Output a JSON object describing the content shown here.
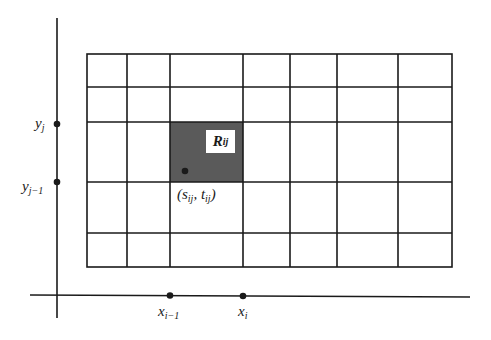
{
  "diagram": {
    "type": "riemann-partition-grid",
    "axes": {
      "y_axis_labels": [
        {
          "base": "y",
          "sub": "j"
        },
        {
          "base": "y",
          "sub": "j−1"
        }
      ],
      "x_axis_labels": [
        {
          "base": "x",
          "sub": "i−1"
        },
        {
          "base": "x",
          "sub": "i"
        }
      ]
    },
    "grid": {
      "columns": 8,
      "rows": 5,
      "vertical_lines_px": [
        87,
        127,
        170,
        243,
        290,
        337,
        398,
        452
      ],
      "horizontal_lines_px": [
        54,
        87,
        122,
        182,
        233,
        267
      ]
    },
    "highlighted_cell": {
      "label_base": "R",
      "label_sub": "ij",
      "fill": "#5a5a5a"
    },
    "sample_point": {
      "open": "(",
      "s_base": "s",
      "s_sub": "ij",
      "sep": ", ",
      "t_base": "t",
      "t_sub": "ij",
      "close": ")"
    },
    "colors": {
      "line": "#1a1a1a",
      "shade": "#5a5a5a",
      "background": "#ffffff"
    }
  }
}
